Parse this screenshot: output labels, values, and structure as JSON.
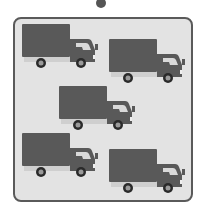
{
  "scene": {
    "description": "Picture of five delivery trucks inside a rounded frame",
    "colors": {
      "frame_fill": "#e3e3e3",
      "frame_border": "#5a5a5a",
      "truck_body": "#595959",
      "window": "#d9d9d9",
      "chassis": "#cfcfcf",
      "wheel": "#2a2a2a",
      "hub": "#9a9a9a",
      "dot": "#555555"
    },
    "truck_count": 5,
    "trucks": [
      {
        "id": "truck-1",
        "x": 20,
        "y": 22
      },
      {
        "id": "truck-2",
        "x": 107,
        "y": 37
      },
      {
        "id": "truck-3",
        "x": 57,
        "y": 84
      },
      {
        "id": "truck-4",
        "x": 20,
        "y": 131
      },
      {
        "id": "truck-5",
        "x": 107,
        "y": 147
      }
    ]
  }
}
